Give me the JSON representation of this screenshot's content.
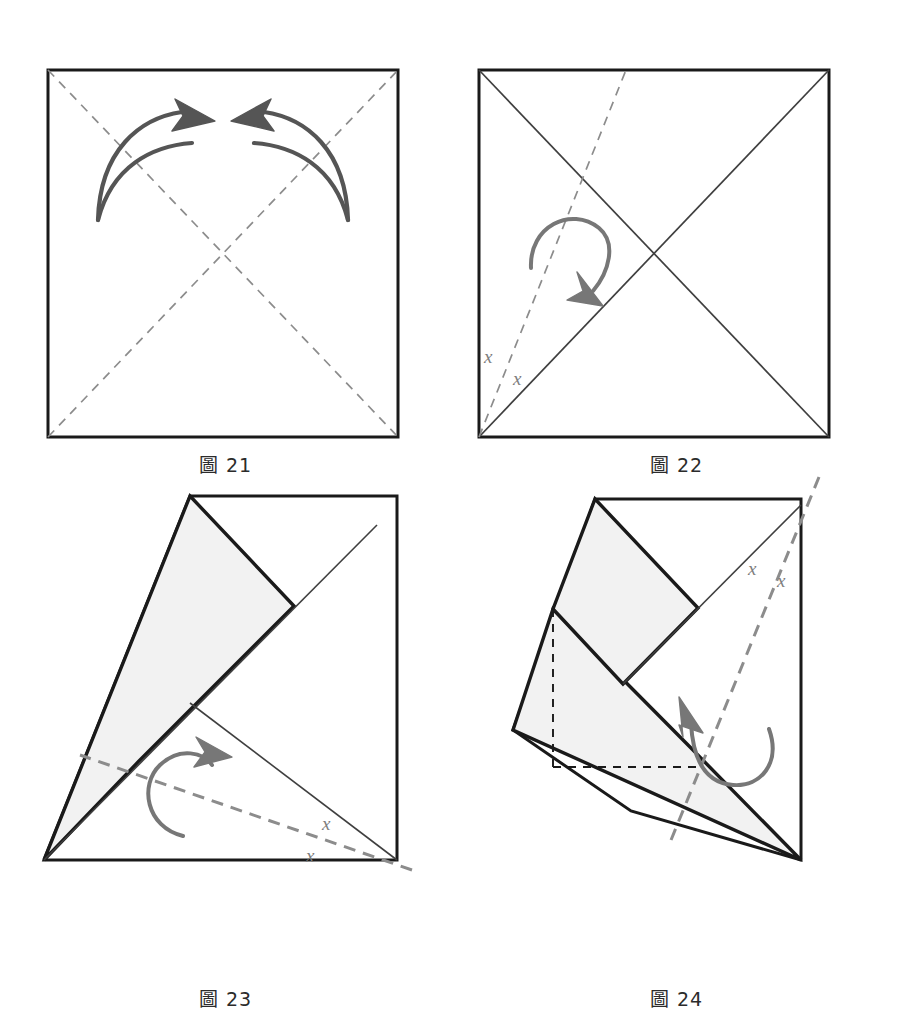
{
  "document": {
    "kind": "origami-folding-instructions",
    "page_background": "#ffffff"
  },
  "colors": {
    "paper_edge": "#1a1a1a",
    "paper_fill_front": "#ffffff",
    "paper_fill_back": "#f2f2f2",
    "crease_existing": "#3f3f3f",
    "fold_line_dashed": "#8c8c8c",
    "hidden_edge_dashed": "#1a1a1a",
    "arrow": "#555555",
    "label_text": "#7d7d7d",
    "caption_text": "#2b2b2b"
  },
  "panels": [
    {
      "id": "fig21",
      "caption": "圖 21",
      "caption_label": "圖",
      "caption_number": "21",
      "description": "Square sheet with both diagonals shown as dashed fold lines; two curved arrows point inward toward the centre.",
      "shape": "square",
      "fold_lines": [
        "diagonal-tl-br",
        "diagonal-bl-tr"
      ],
      "fold_line_style": "dashed",
      "arrows": [
        {
          "name": "left-fold-arrow",
          "direction": "right",
          "style": "valley-double-curve"
        },
        {
          "name": "right-fold-arrow",
          "direction": "left",
          "style": "valley-double-curve"
        }
      ],
      "angle_labels": []
    },
    {
      "id": "fig22",
      "caption": "圖 22",
      "caption_label": "圖",
      "caption_number": "22",
      "description": "Square with both diagonals creased as solid lines; a dashed angle-bisector runs from the bottom-left corner to the top edge. A curved arrow shows the flap folding to the right.",
      "shape": "square",
      "crease_lines": [
        "diagonal-tl-br",
        "diagonal-bl-tr"
      ],
      "fold_lines": [
        "bisector-from-bottom-left"
      ],
      "fold_line_style": "dashed",
      "arrows": [
        {
          "name": "fold-arrow",
          "direction": "clockwise-down",
          "style": "valley-single-curve"
        }
      ],
      "angle_labels": [
        {
          "text": "x",
          "position": "left-of-bisector"
        },
        {
          "text": "x",
          "position": "right-of-bisector"
        }
      ]
    },
    {
      "id": "fig23",
      "caption": "圖 23",
      "caption_label": "圖",
      "caption_number": "23",
      "description": "One corner has been folded in along the bisector, producing a shaded kite flap over the square. A new dashed bisector runs from the bottom-right corner; a curved arrow shows the next fold.",
      "shape": "folded-square-one-flap",
      "crease_lines": [
        "diagonal-bl-tr"
      ],
      "fold_lines": [
        "bisector-from-bottom-right"
      ],
      "fold_line_style": "dashed",
      "arrows": [
        {
          "name": "fold-arrow",
          "direction": "counter-clockwise-right",
          "style": "valley-single-curve"
        }
      ],
      "angle_labels": [
        {
          "text": "x",
          "position": "above-bisector"
        },
        {
          "text": "x",
          "position": "below-bisector"
        }
      ]
    },
    {
      "id": "fig24",
      "caption": "圖 24",
      "caption_label": "圖",
      "caption_number": "24",
      "description": "Two corners folded in; shaded flaps overlap with hidden edges shown as black dashed lines. A dashed bisector from the top-right corner and a curved arrow indicate the next fold.",
      "shape": "folded-square-two-flaps",
      "crease_lines": [
        "diagonal-from-top-right"
      ],
      "fold_lines": [
        "bisector-from-top-right"
      ],
      "fold_line_style": "dashed",
      "hidden_lines": [
        "vertical-hidden-edge",
        "horizontal-hidden-edge"
      ],
      "arrows": [
        {
          "name": "fold-arrow",
          "direction": "counter-clockwise-up",
          "style": "valley-single-curve"
        }
      ],
      "angle_labels": [
        {
          "text": "x",
          "position": "left-of-bisector"
        },
        {
          "text": "x",
          "position": "right-of-bisector"
        }
      ]
    }
  ]
}
